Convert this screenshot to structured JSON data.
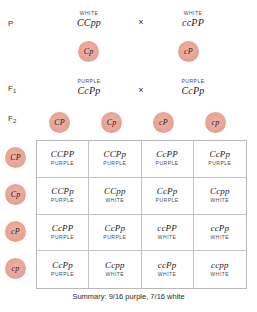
{
  "generations": {
    "p_label": "P",
    "f1_label": "F",
    "f1_sub": "1",
    "f2_label": "F",
    "f2_sub": "2"
  },
  "cross_symbol": "×",
  "parental": {
    "left": {
      "phenotype": "WHITE",
      "genotype": "CCpp"
    },
    "right": {
      "phenotype": "WHITE",
      "genotype": "ccPP"
    },
    "gametes": [
      "Cp",
      "cP"
    ]
  },
  "f1": {
    "left": {
      "phenotype": "PURPLE",
      "genotype": "CcPp"
    },
    "right": {
      "phenotype": "PURPLE",
      "genotype": "CcPp"
    }
  },
  "f2": {
    "top_gametes": [
      "CP",
      "Cp",
      "cP",
      "cp"
    ],
    "side_gametes": [
      "CP",
      "Cp",
      "cP",
      "cp"
    ]
  },
  "punnett": {
    "cells": [
      {
        "genotype": "CCPP",
        "phenotype": "PURPLE"
      },
      {
        "genotype": "CCPp",
        "phenotype": "PURPLE"
      },
      {
        "genotype": "CcPP",
        "phenotype": "PURPLE"
      },
      {
        "genotype": "CcPp",
        "phenotype": "PURPLE"
      },
      {
        "genotype": "CCPp",
        "phenotype": "PURPLE"
      },
      {
        "genotype": "CCpp",
        "phenotype": "WHITE"
      },
      {
        "genotype": "CcPp",
        "phenotype": "PURPLE"
      },
      {
        "genotype": "Ccpp",
        "phenotype": "WHITE"
      },
      {
        "genotype": "CcPP",
        "phenotype": "PURPLE"
      },
      {
        "genotype": "CcPp",
        "phenotype": "PURPLE"
      },
      {
        "genotype": "ccPP",
        "phenotype": "WHITE"
      },
      {
        "genotype": "ccPp",
        "phenotype": "WHITE"
      },
      {
        "genotype": "CcPp",
        "phenotype": "PURPLE"
      },
      {
        "genotype": "Ccpp",
        "phenotype": "WHITE"
      },
      {
        "genotype": "ccPp",
        "phenotype": "WHITE"
      },
      {
        "genotype": "ccpp",
        "phenotype": "WHITE"
      }
    ]
  },
  "summary": "Summary: 9/16 purple, 7/16 white",
  "colors": {
    "gamete_fill": "#e8a394",
    "grid_line": "#c4c4c4",
    "text": "#1a1a1a"
  }
}
